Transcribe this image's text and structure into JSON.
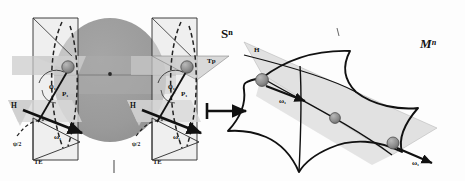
{
  "figure": {
    "title_left": "Sⁿ",
    "title_right": "Mⁿ",
    "arrow": "map-arrow",
    "background": "#fdfdfd"
  },
  "colors": {
    "sphere_fill": "#9a9a9a",
    "plane_fill": "#c9c9c9",
    "plane_fill_light": "#dcdcdc",
    "node_fill": "#8c8c8c",
    "stroke": "#1a1a1a",
    "dashed": "#2b2b2b"
  },
  "left_panel": {
    "name": "sphere-diagram",
    "space_label": "Sⁿ",
    "sphere": {
      "name": "n-sphere",
      "center_label": "·"
    },
    "copies": [
      {
        "name": "frame-copy-1",
        "labels": {
          "angle": "φ₁",
          "point": "P₁",
          "horizontal": "H",
          "omega": "ω₁",
          "psi": "ψ/2",
          "tangent_e": "TE",
          "tangent_p": ""
        }
      },
      {
        "name": "frame-copy-2",
        "labels": {
          "angle": "φ₁",
          "point": "P₁",
          "horizontal": "H",
          "omega": "ω₁",
          "psi": "ψ/2",
          "tangent_e": "TE",
          "tangent_p": "Tp"
        }
      }
    ]
  },
  "right_panel": {
    "name": "manifold-diagram",
    "space_label": "Mⁿ",
    "labels": {
      "horizontal": "H",
      "omega_upper": "ω₁",
      "omega_lower": "ω₁"
    },
    "nodes": [
      {
        "name": "node-upper-left"
      },
      {
        "name": "node-center"
      },
      {
        "name": "node-lower-right"
      }
    ]
  }
}
